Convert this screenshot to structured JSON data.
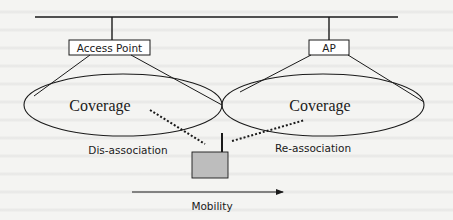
{
  "diagram": {
    "access_points": [
      {
        "label": "Access Point",
        "coverage_label": "Coverage"
      },
      {
        "label": "AP",
        "coverage_label": "Coverage"
      }
    ],
    "station": {
      "label_left": "Dis-association",
      "label_right": "Re-association"
    },
    "mobility": {
      "label": "Mobility"
    },
    "colors": {
      "line": "#1a1a1a",
      "station_fill": "#bdbdbd",
      "background": "#f4f4f2"
    }
  }
}
